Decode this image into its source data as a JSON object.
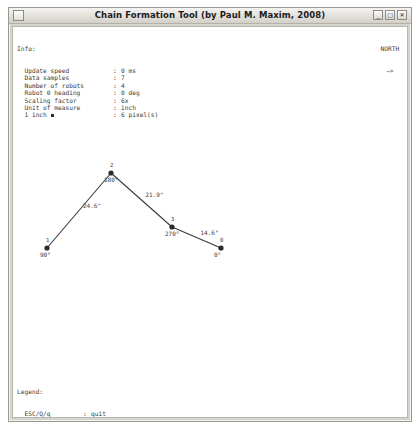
{
  "window": {
    "title": "Chain Formation Tool (by Paul M. Maxim, 2008)",
    "minimize_label": "_",
    "maximize_label": "□",
    "close_label": "✕"
  },
  "info": {
    "heading": "Info:",
    "rows": [
      {
        "key": "Update speed",
        "sep": ":",
        "value": "0 ms"
      },
      {
        "key": "Data samples",
        "sep": ":",
        "value": "7"
      },
      {
        "key": "Number of robots",
        "sep": ":",
        "value": "4"
      },
      {
        "key": "Robot 0 heading",
        "sep": ":",
        "value": "0 deg"
      },
      {
        "key": "Scaling factor",
        "sep": ":",
        "value": "6x"
      },
      {
        "key": "Unit of measure",
        "sep": ":",
        "value": "inch"
      },
      {
        "key": "1 inch",
        "sep": ":",
        "value": "6 pixel(s)"
      }
    ]
  },
  "compass": {
    "label": "NORTH",
    "arrow": "—>"
  },
  "legend": {
    "heading": "Legend:",
    "rows": [
      {
        "key": "ESC/Q/q",
        "sep": ":",
        "value": "quit"
      },
      {
        "key": "SPACE/S/s",
        "sep": ":",
        "value": "pause/unpause"
      },
      {
        "key": ".",
        "sep": ":",
        "value": "step by step"
      },
      {
        "key": "DOWN/UP",
        "sep": ":",
        "value": "+/- simulation speed"
      },
      {
        "key": "RIGHT/LEFT",
        "sep": ":",
        "value": "+/- scaling factor"
      }
    ]
  },
  "chart_data": {
    "type": "scatter",
    "title": "Chain Formation",
    "xlabel": "",
    "ylabel": "",
    "units": "inch",
    "nodes": [
      {
        "id": "1",
        "x": 34,
        "y": 221,
        "heading": "90°"
      },
      {
        "id": "2",
        "x": 98,
        "y": 146,
        "heading": "180°"
      },
      {
        "id": "3",
        "x": 159,
        "y": 200,
        "heading": "270°"
      },
      {
        "id": "0",
        "x": 208,
        "y": 221,
        "heading": "0°"
      }
    ],
    "edges": [
      {
        "from": "1",
        "to": "2",
        "length": "24.6\""
      },
      {
        "from": "2",
        "to": "3",
        "length": "21.9\""
      },
      {
        "from": "3",
        "to": "0",
        "length": "14.6\""
      }
    ]
  }
}
